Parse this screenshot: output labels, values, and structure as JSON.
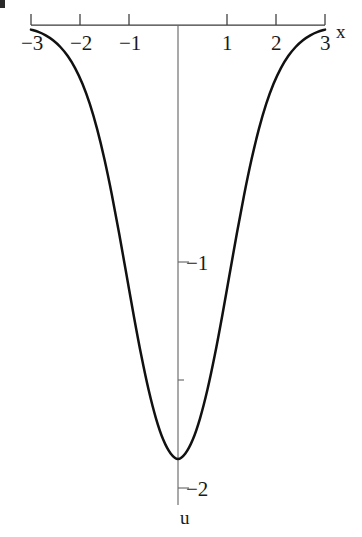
{
  "figure": {
    "background_color": "#ffffff",
    "curve_color": "#111111",
    "axis_color": "#3a3a3a"
  },
  "axes": {
    "x_axis_label": "x",
    "y_axis_label": "u",
    "x_ticks": [
      {
        "value": -3,
        "label": "−3"
      },
      {
        "value": -2,
        "label": "−2"
      },
      {
        "value": -1,
        "label": "−1"
      },
      {
        "value": 1,
        "label": "1"
      },
      {
        "value": 2,
        "label": "2"
      },
      {
        "value": 3,
        "label": "3"
      }
    ],
    "y_ticks": [
      {
        "value": -1,
        "label": "−1"
      },
      {
        "value": -2,
        "label": "−2"
      }
    ]
  },
  "chart_data": {
    "type": "line",
    "title": "",
    "xlabel": "x",
    "ylabel": "u",
    "xlim": [
      -3,
      3
    ],
    "ylim": [
      -2.08,
      0.02
    ],
    "grid": false,
    "legend": null,
    "xticks": [
      -3,
      -2,
      -1,
      1,
      2,
      3
    ],
    "xticklabels": [
      "−3",
      "−2",
      "−1",
      "1",
      "2",
      "3"
    ],
    "yticks": [
      -1,
      -2
    ],
    "yticklabels": [
      "−1",
      "−2"
    ],
    "series": [
      {
        "name": "u(x)",
        "color": "#111111",
        "x": [
          -3.0,
          -2.85,
          -2.7,
          -2.55,
          -2.4,
          -2.25,
          -2.1,
          -1.95,
          -1.8,
          -1.65,
          -1.5,
          -1.35,
          -1.2,
          -1.05,
          -0.9,
          -0.75,
          -0.6,
          -0.45,
          -0.3,
          -0.15,
          0.0,
          0.15,
          0.3,
          0.45,
          0.6,
          0.75,
          0.9,
          1.05,
          1.2,
          1.35,
          1.5,
          1.65,
          1.8,
          1.95,
          2.1,
          2.25,
          2.4,
          2.55,
          2.7,
          2.85,
          3.0
        ],
        "y": [
          -0.02,
          -0.03,
          -0.045,
          -0.066,
          -0.095,
          -0.134,
          -0.186,
          -0.254,
          -0.341,
          -0.45,
          -0.581,
          -0.733,
          -0.902,
          -1.08,
          -1.259,
          -1.427,
          -1.576,
          -1.699,
          -1.792,
          -1.851,
          -1.875,
          -1.851,
          -1.792,
          -1.699,
          -1.576,
          -1.427,
          -1.259,
          -1.08,
          -0.902,
          -0.733,
          -0.581,
          -0.45,
          -0.341,
          -0.254,
          -0.186,
          -0.134,
          -0.095,
          -0.066,
          -0.045,
          -0.03,
          -0.02
        ]
      }
    ]
  }
}
